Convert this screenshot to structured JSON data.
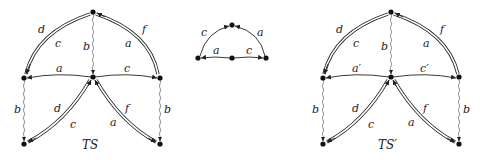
{
  "diagram": {
    "ts": {
      "caption": "TS",
      "labels": {
        "top_left_outer": "d",
        "top_left_inner": "c",
        "top_right_outer": "f",
        "top_right_inner": "a",
        "vertical_top": "b",
        "mid_left": "a",
        "mid_right": "c",
        "left_vertical": "b",
        "right_vertical": "b",
        "bottom_left_outer": "d",
        "bottom_left_inner": "c",
        "bottom_right_outer": "f",
        "bottom_right_inner": "a"
      }
    },
    "middle": {
      "labels": {
        "arc_left": "c",
        "arc_right": "a",
        "base_left": "a",
        "base_right": "c"
      }
    },
    "ts_prime": {
      "caption": "TS′",
      "labels": {
        "top_left_outer": "d",
        "top_left_inner": "c",
        "top_right_outer": "f",
        "top_right_inner": "a",
        "vertical_top": "b",
        "mid_left": "a′",
        "mid_right": "c′",
        "left_vertical": "b",
        "right_vertical": "b",
        "bottom_left_outer": "d",
        "bottom_left_inner": "c",
        "bottom_right_outer": "f",
        "bottom_right_inner": "a"
      }
    }
  }
}
